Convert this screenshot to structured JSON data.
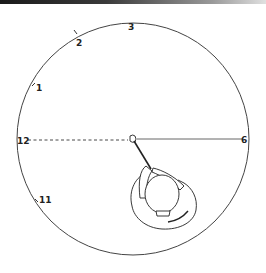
{
  "diagram": {
    "clock_labels": [
      {
        "key": "1",
        "text": "1"
      },
      {
        "key": "2",
        "text": "2"
      },
      {
        "key": "3",
        "text": "3"
      },
      {
        "key": "6",
        "text": "6"
      },
      {
        "key": "11",
        "text": "11"
      },
      {
        "key": "12",
        "text": "12"
      }
    ],
    "lines": [
      {
        "name": "target-line-to-12",
        "style": "dashed",
        "to": "12"
      },
      {
        "name": "line-to-6",
        "style": "solid",
        "to": "6"
      }
    ],
    "figure": "golfer viewed from above, club shaft pointing to ball at center",
    "colors": {
      "ink": "#222222",
      "background": "#ffffff"
    }
  }
}
